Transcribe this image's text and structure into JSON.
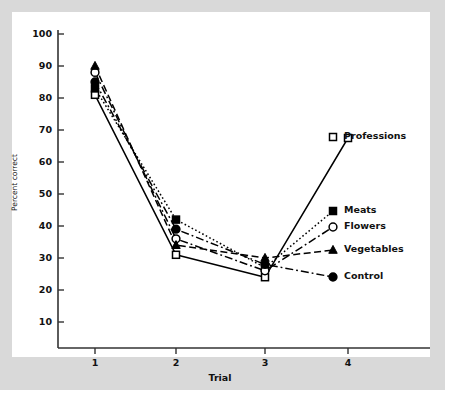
{
  "chart_data": {
    "type": "line",
    "title": "",
    "subtitle": "",
    "xlabel": "Trial",
    "ylabel": "Percent correct",
    "x": [
      1,
      2,
      3,
      4
    ],
    "xtick_labels": [
      "1",
      "2",
      "3",
      "4"
    ],
    "ytick_labels": [
      "10",
      "20",
      "30",
      "40",
      "50",
      "60",
      "70",
      "80",
      "90",
      "100"
    ],
    "ytick_values": [
      10,
      20,
      30,
      40,
      50,
      60,
      70,
      80,
      90,
      100
    ],
    "ylim": [
      0,
      100
    ],
    "xlim": [
      0.6,
      4.5
    ],
    "grid": false,
    "legend_position": "inside-right",
    "series": [
      {
        "name": "Professions",
        "marker": "open-square",
        "line_style": "solid",
        "color": "#000000",
        "values": [
          81,
          31,
          24,
          67.5
        ]
      },
      {
        "name": "Meats",
        "marker": "filled-square",
        "line_style": "dotted",
        "color": "#000000",
        "values": [
          83,
          42,
          27,
          44
        ]
      },
      {
        "name": "Flowers",
        "marker": "open-circle",
        "line_style": "dash-dot",
        "color": "#000000",
        "values": [
          88,
          36,
          26,
          40
        ]
      },
      {
        "name": "Vegetables",
        "marker": "filled-triangle",
        "line_style": "dashed",
        "color": "#000000",
        "values": [
          90,
          34,
          30,
          32
        ]
      },
      {
        "name": "Control",
        "marker": "filled-circle",
        "line_style": "dash-dot",
        "color": "#000000",
        "values": [
          85,
          39,
          28,
          25
        ]
      }
    ]
  },
  "legend": {
    "entries": [
      {
        "label": "Professions",
        "marker": "open-square"
      },
      {
        "label": "Meats",
        "marker": "filled-square"
      },
      {
        "label": "Flowers",
        "marker": "open-circle"
      },
      {
        "label": "Vegetables",
        "marker": "filled-triangle"
      },
      {
        "label": "Control",
        "marker": "filled-circle"
      }
    ]
  },
  "colors": {
    "ink": "#000000",
    "axis": "#333333",
    "page_background": "#d9d9d9",
    "plot_background": "#ffffff"
  }
}
